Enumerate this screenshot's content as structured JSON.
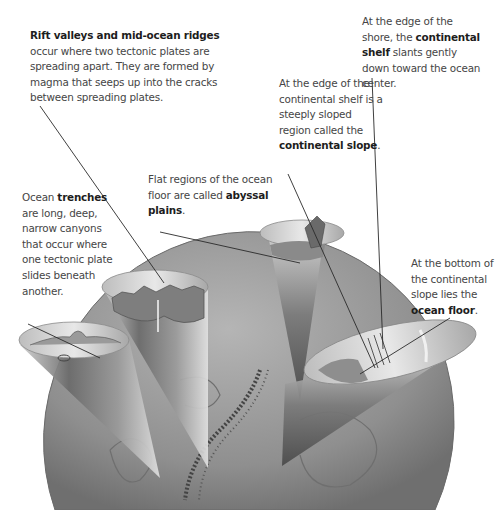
{
  "callouts": {
    "rift": {
      "bold": "Rift valleys and mid-ocean ridges",
      "text": "occur where two tectonic plates are spreading apart. They are formed by magma that seeps up into the cracks between spreading plates."
    },
    "abyss": {
      "text": "Flat regions of the ocean floor are called",
      "bold": "abyssal plains",
      "end": "."
    },
    "trench": {
      "pre": "Ocean",
      "bold": "trenches",
      "text": "are long, deep, narrow canyons that occur where one tectonic plate slides beneath another."
    },
    "slope": {
      "text": "At the edge of the continental shelf is a steeply sloped region called the",
      "bold": "continental slope",
      "end": "."
    },
    "shelf": {
      "pre": "At the edge of the shore, the",
      "bold": "continental shelf",
      "text": "slants gently down toward the ocean center."
    },
    "floor": {
      "text": "At the bottom of the continental slope lies the",
      "bold": "ocean floor",
      "end": "."
    }
  },
  "colors": {
    "globe": "#9a9a9a",
    "cone_dark": "#5a5a5a",
    "cone_light": "#d8d8d8",
    "leader_line": "#2a2a2a",
    "text": "#454545",
    "bold_text": "#1d1d1d"
  }
}
